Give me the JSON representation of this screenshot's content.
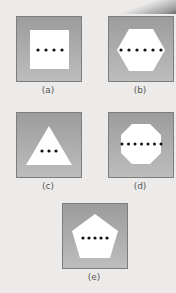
{
  "figure": {
    "panels": [
      {
        "id": "a",
        "label": "(a)",
        "shape": "square",
        "dots": 4
      },
      {
        "id": "b",
        "label": "(b)",
        "shape": "hexagon",
        "dots": 6
      },
      {
        "id": "c",
        "label": "(c)",
        "shape": "triangle",
        "dots": 3
      },
      {
        "id": "d",
        "label": "(d)",
        "shape": "octagon",
        "dots": 8
      },
      {
        "id": "e",
        "label": "(e)",
        "shape": "pentagon",
        "dots": 5
      }
    ],
    "colors": {
      "background": "#ecebea",
      "panel_top": "#9c9c9c",
      "panel_bottom": "#bdbdbd",
      "shape_fill": "#ffffff",
      "dot": "#111111"
    }
  }
}
